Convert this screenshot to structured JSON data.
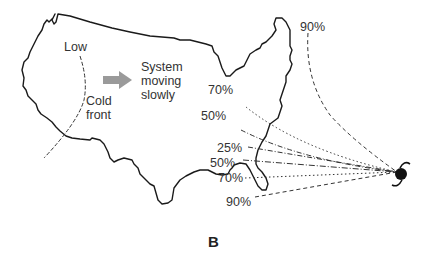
{
  "figure": {
    "panel_label": "B",
    "labels": {
      "low": "Low",
      "cold_front": "Cold\nfront",
      "system_moving": "System\nmoving\nslowly"
    },
    "icons": {
      "arrow": "gray-arrow-right-icon",
      "hurricane": "hurricane-icon"
    },
    "probabilities": [
      {
        "label": "90%",
        "position": "top",
        "style": "dashed"
      },
      {
        "label": "70%",
        "position": "upper",
        "style": "dotted"
      },
      {
        "label": "50%",
        "position": "upper-mid",
        "style": "dash-dot"
      },
      {
        "label": "25%",
        "position": "mid",
        "style": "dash-dot"
      },
      {
        "label": "50%",
        "position": "lower-mid",
        "style": "dash-dot"
      },
      {
        "label": "70%",
        "position": "lower",
        "style": "dotted"
      },
      {
        "label": "90%",
        "position": "bottom",
        "style": "dashed"
      }
    ],
    "colors": {
      "outline": "#1a1a1a",
      "arrow": "#9a9a9a",
      "text": "#333333"
    }
  }
}
